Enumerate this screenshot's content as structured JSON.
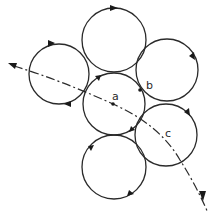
{
  "diagram": {
    "stroke_color": "#2a2a2a",
    "background": "#ffffff",
    "circles": [
      {
        "id": "top",
        "cx": 114,
        "cy": 40,
        "r": 32
      },
      {
        "id": "upper-left",
        "cx": 59,
        "cy": 74,
        "r": 30
      },
      {
        "id": "upper-right",
        "cx": 167,
        "cy": 70,
        "r": 31
      },
      {
        "id": "center",
        "cx": 114,
        "cy": 104,
        "r": 31
      },
      {
        "id": "lower-right",
        "cx": 166,
        "cy": 135,
        "r": 31
      },
      {
        "id": "bottom",
        "cx": 114,
        "cy": 167,
        "r": 32
      }
    ],
    "labels": [
      {
        "id": "a",
        "text": "a",
        "x": 112,
        "y": 100
      },
      {
        "id": "b",
        "text": "b",
        "x": 146,
        "y": 89
      },
      {
        "id": "c",
        "text": "c",
        "x": 165,
        "y": 137
      }
    ],
    "points": [
      {
        "id": "point-a",
        "x": 113,
        "y": 104
      },
      {
        "id": "point-b",
        "x": 140,
        "y": 90
      }
    ],
    "trajectory": {
      "arrow_start": {
        "x": 10,
        "y": 64
      },
      "arrow_end": {
        "x": 205,
        "y": 200
      }
    }
  }
}
